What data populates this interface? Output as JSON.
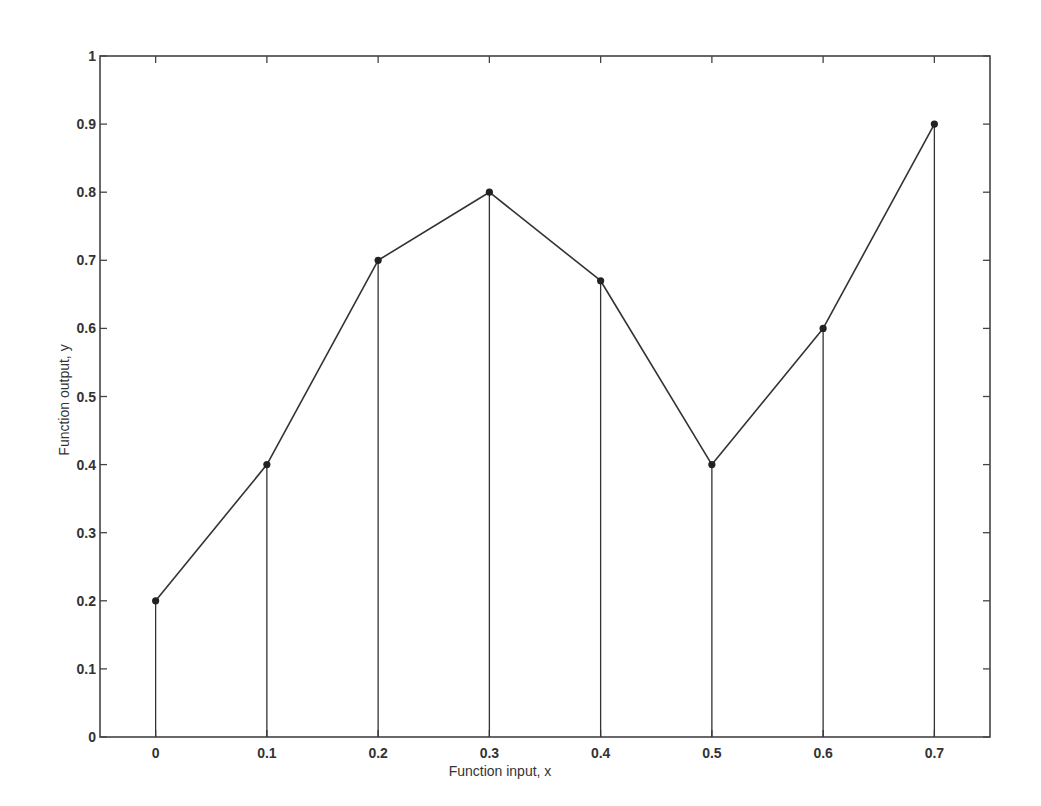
{
  "chart_data": {
    "type": "line",
    "subtype": "stem-with-connecting-line",
    "title": "",
    "xlabel": "Function input, x",
    "ylabel": "Function output, y",
    "x": [
      0,
      0.1,
      0.2,
      0.3,
      0.4,
      0.5,
      0.6,
      0.7
    ],
    "series": [
      {
        "name": "y",
        "values": [
          0.2,
          0.4,
          0.7,
          0.8,
          0.67,
          0.4,
          0.6,
          0.9
        ]
      }
    ],
    "xlim": [
      -0.05,
      0.75
    ],
    "ylim": [
      0,
      1
    ],
    "xticks": [
      0,
      0.1,
      0.2,
      0.3,
      0.4,
      0.5,
      0.6,
      0.7
    ],
    "xtick_labels": [
      "0",
      "0.1",
      "0.2",
      "0.3",
      "0.4",
      "0.5",
      "0.6",
      "0.7"
    ],
    "yticks": [
      0,
      0.1,
      0.2,
      0.3,
      0.4,
      0.5,
      0.6,
      0.7,
      0.8,
      0.9,
      1
    ],
    "ytick_labels": [
      "0",
      "0.1",
      "0.2",
      "0.3",
      "0.4",
      "0.5",
      "0.6",
      "0.7",
      "0.8",
      "0.9",
      "1"
    ],
    "grid": false,
    "legend": null,
    "colors": {
      "line": "#333333",
      "marker": "#222222",
      "axes": "#444444",
      "text": "#333333"
    }
  }
}
